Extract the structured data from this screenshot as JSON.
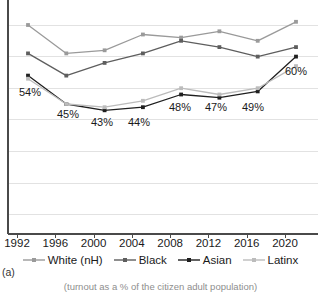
{
  "panel_letter": "(a)",
  "caption": "(turnout as a % of the citizen adult population)",
  "x_axis": {
    "ticks": [
      "1992",
      "1996",
      "2000",
      "2004",
      "2008",
      "2012",
      "2016",
      "2020"
    ]
  },
  "legend": {
    "items": [
      {
        "label": "White (nH)",
        "color": "#9a9a9a",
        "marker": "square-marker"
      },
      {
        "label": "Black",
        "color": "#5e5e5e",
        "marker": "square-marker"
      },
      {
        "label": "Asian",
        "color": "#1f1f1f",
        "marker": "square-marker"
      },
      {
        "label": "Latinx",
        "color": "#bcbcbc",
        "marker": "square-marker"
      }
    ]
  },
  "data_labels": [
    {
      "text": "54%",
      "x": 30,
      "y": 96
    },
    {
      "text": "45%",
      "x": 68,
      "y": 118
    },
    {
      "text": "43%",
      "x": 102,
      "y": 126
    },
    {
      "text": "44%",
      "x": 139,
      "y": 126
    },
    {
      "text": "48%",
      "x": 180,
      "y": 111
    },
    {
      "text": "47%",
      "x": 216,
      "y": 111
    },
    {
      "text": "49%",
      "x": 253,
      "y": 111
    },
    {
      "text": "60%",
      "x": 296,
      "y": 75
    }
  ],
  "chart_data": {
    "type": "line",
    "title": "",
    "subtitle": "",
    "xlabel": "",
    "ylabel": "",
    "caption": "(turnout as a % of the citizen adult population)",
    "grid": true,
    "legend_position": "bottom",
    "categories": [
      "1992",
      "1996",
      "2000",
      "2004",
      "2008",
      "2012",
      "2016",
      "2020"
    ],
    "ylim": [
      0,
      80
    ],
    "yticks": [
      0,
      10,
      20,
      30,
      40,
      50,
      60,
      70
    ],
    "series": [
      {
        "name": "White (nH)",
        "color": "#9a9a9a",
        "values": [
          70,
          61,
          62,
          67,
          66,
          68,
          65,
          71
        ]
      },
      {
        "name": "Black",
        "color": "#5e5e5e",
        "values": [
          61,
          54,
          58,
          61,
          65,
          63,
          60,
          63
        ]
      },
      {
        "name": "Asian",
        "color": "#1f1f1f",
        "values": [
          54,
          45,
          43,
          44,
          48,
          47,
          49,
          60
        ]
      },
      {
        "name": "Latinx",
        "color": "#bcbcbc",
        "values": [
          53,
          45,
          44,
          46,
          50,
          48,
          50,
          57
        ]
      }
    ],
    "annotated_series": "Asian",
    "annotations": [
      "54%",
      "45%",
      "43%",
      "44%",
      "48%",
      "47%",
      "49%",
      "60%"
    ]
  }
}
